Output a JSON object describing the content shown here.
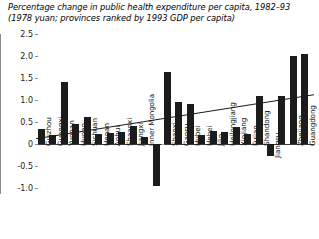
{
  "title": {
    "line1": "Percentage change in public health expenditure per capita, 1982–93",
    "line2": "(1978 yuan; provinces ranked by 1993 GDP per capita)"
  },
  "chart_data": {
    "type": "bar",
    "title": "Percentage change in public health expenditure per capita, 1982–93 (1978 yuan; provinces ranked by 1993 GDP per capita)",
    "xlabel": "",
    "ylabel": "",
    "ylim": [
      -1.0,
      2.5
    ],
    "yticks": [
      "2.5",
      "2.0",
      "1.5",
      "1.0",
      "0.5",
      "0",
      "-0.5",
      "-1.0"
    ],
    "ytick_values": [
      2.5,
      2.0,
      1.5,
      1.0,
      0.5,
      0,
      -0.5,
      -1.0
    ],
    "grid": false,
    "legend": "none",
    "categories": [
      "Guizhou",
      "Guangxi",
      "Yunnan",
      "Hunan",
      "Sichuan",
      "Henan",
      "Anhui",
      "Shaanxi",
      "Jiangxi",
      "Inner Mongolia",
      "Ningxia",
      "Shanxi",
      "Gansu",
      "Hubei",
      "Hebei",
      "Jilin",
      "Heilongjiang",
      "Xinjiang",
      "Fujian",
      "Shandong",
      "Jiangsu",
      "Liaoning",
      "Zhejiang",
      "Guangdong"
    ],
    "values": [
      0.33,
      0.2,
      1.42,
      0.45,
      0.62,
      0.22,
      0.24,
      0.27,
      0.4,
      0.17,
      -0.95,
      1.64,
      0.95,
      0.9,
      0.2,
      0.3,
      0.28,
      0.39,
      0.23,
      1.09,
      -0.27,
      1.08,
      2.0,
      2.05
    ],
    "series": [
      {
        "name": "Percentage change 1982–93",
        "values": [
          0.33,
          0.2,
          1.42,
          0.45,
          0.62,
          0.22,
          0.24,
          0.27,
          0.4,
          0.17,
          -0.95,
          1.64,
          0.95,
          0.9,
          0.2,
          0.3,
          0.28,
          0.39,
          0.23,
          1.09,
          -0.27,
          1.08,
          2.0,
          2.05
        ]
      }
    ],
    "trendline": {
      "type": "linear",
      "y_start": 0.12,
      "y_end": 1.12,
      "description": "Upward sloping fitted trend line across provinces"
    },
    "white_labels": [
      "Ningxia",
      "Liaoning"
    ],
    "colors": {
      "bar": "#1c1c1c",
      "axis": "#8a8a8a",
      "trend": "#1a1a1a",
      "background": "#ffffff"
    }
  }
}
